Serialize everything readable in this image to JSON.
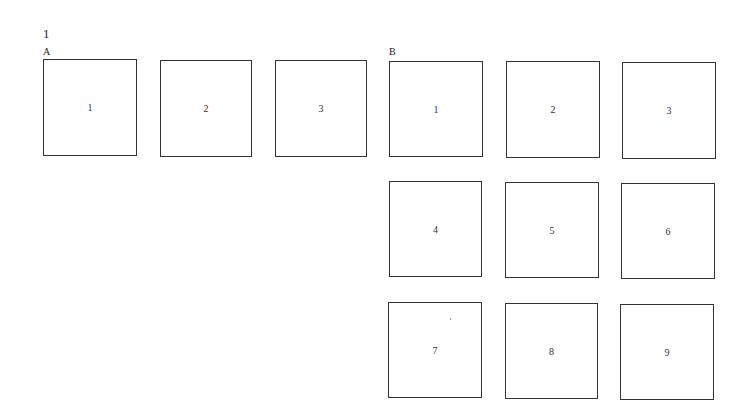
{
  "figure": {
    "number": "1",
    "groups": [
      {
        "label": "A",
        "boxes": [
          "1",
          "2",
          "3"
        ]
      },
      {
        "label": "B",
        "boxes": [
          "1",
          "2",
          "3",
          "4",
          "5",
          "6",
          "7",
          "8",
          "9"
        ]
      }
    ]
  }
}
